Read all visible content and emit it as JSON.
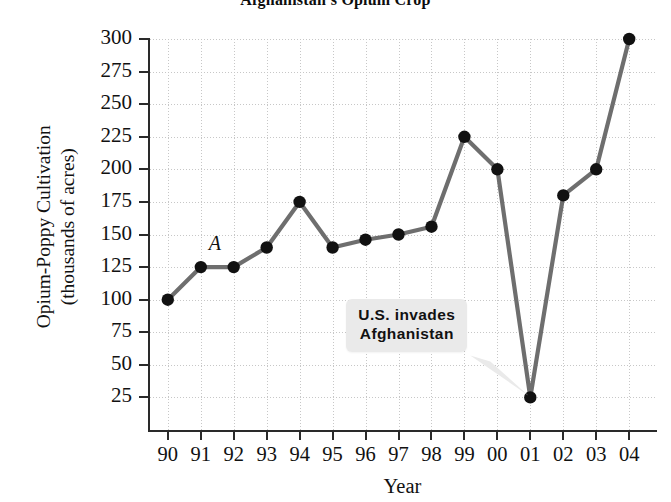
{
  "chart_data": {
    "type": "line",
    "title": "Afghanistan's Opium Crop",
    "xlabel": "Year",
    "ylabel_line1": "Opium-Poppy Cultivation",
    "ylabel_line2": "(thousands of acres)",
    "categories": [
      "90",
      "91",
      "92",
      "93",
      "94",
      "95",
      "96",
      "97",
      "98",
      "99",
      "00",
      "01",
      "02",
      "03",
      "04"
    ],
    "values": [
      100,
      125,
      125,
      140,
      175,
      140,
      146,
      150,
      156,
      225,
      200,
      25,
      180,
      200,
      300
    ],
    "ylim": [
      0,
      300
    ],
    "yticks": [
      300,
      275,
      250,
      225,
      200,
      175,
      150,
      125,
      100,
      75,
      50,
      25
    ],
    "grid": true,
    "legend": "none",
    "series_color": "#6e6e6e",
    "marker_color": "#111111",
    "grid_color": "#c7c7c7",
    "axis_color": "#2a2a2a",
    "annotations": [
      {
        "name": "point-label-a",
        "text": "A",
        "at_category": "91",
        "at_value": 125,
        "style": "italic-serif"
      },
      {
        "name": "us-invades-callout",
        "line1": "U.S. invades",
        "line2": "Afghanistan",
        "points_to_category": "01",
        "points_to_value": 25,
        "box_color": "#eaeaea"
      }
    ]
  }
}
